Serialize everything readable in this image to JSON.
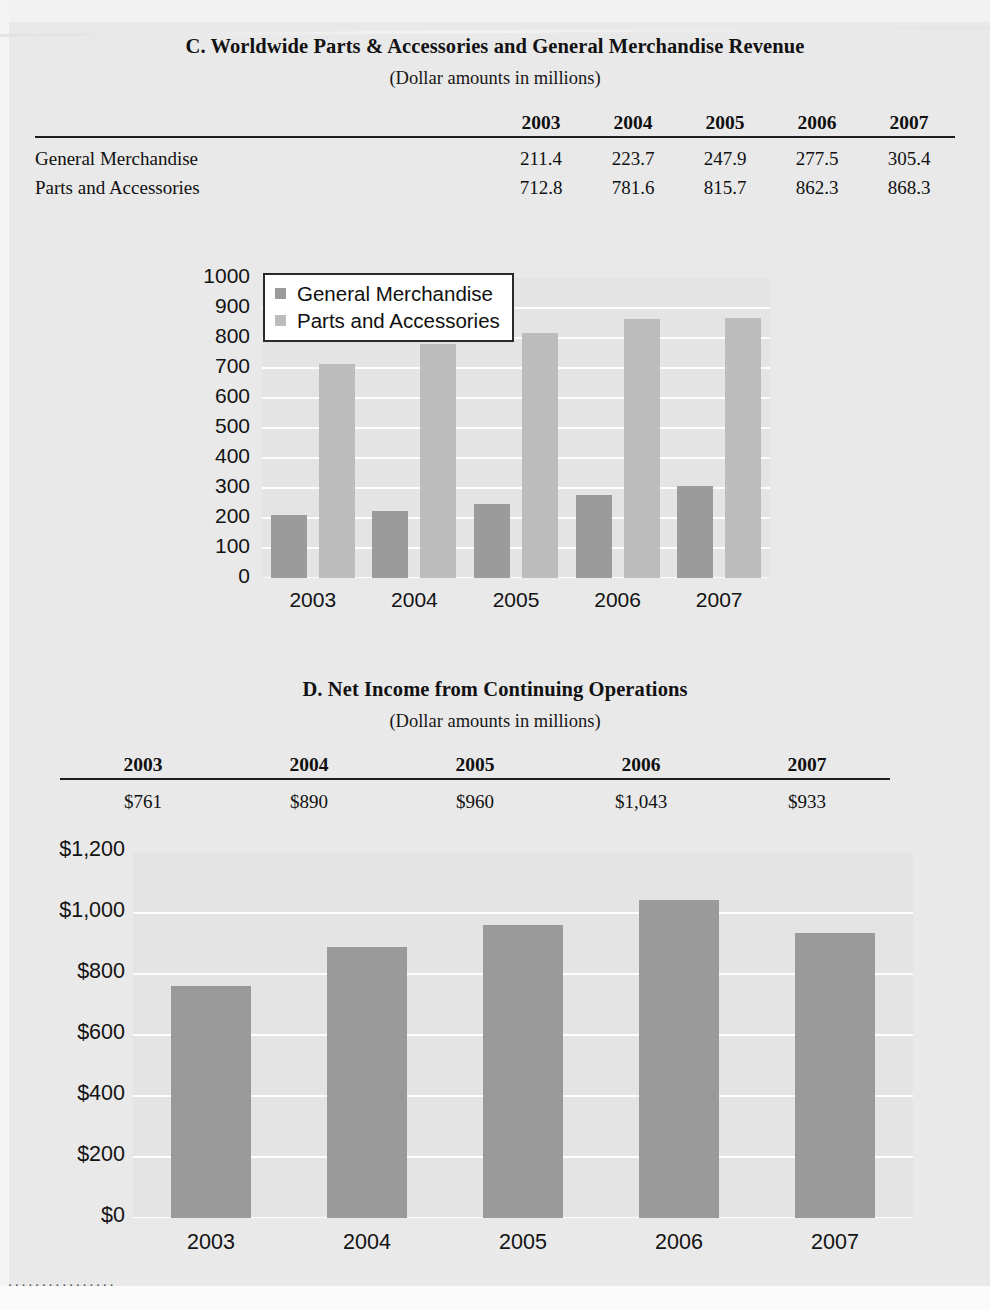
{
  "page": {
    "bottom_dots": "................",
    "colors": {
      "page_background": "#e9e9e9",
      "plot_background": "#e4e4e4",
      "gridline": "#fdfdfd",
      "bar_general_merchandise": "#9b9b9b",
      "bar_parts_and_accessories": "#bcbcbc",
      "bar_net_income": "#9a9a9a",
      "rule": "#1d1d1d",
      "text": "#101010"
    }
  },
  "section_c": {
    "title": "C. Worldwide Parts & Accessories and General Merchandise Revenue",
    "subtitle": "(Dollar amounts in millions)",
    "table": {
      "row_label_header": "",
      "columns": [
        "2003",
        "2004",
        "2005",
        "2006",
        "2007"
      ],
      "rows": [
        {
          "label": "General Merchandise",
          "values": [
            "211.4",
            "223.7",
            "247.9",
            "277.5",
            "305.4"
          ]
        },
        {
          "label": "Parts and Accessories",
          "values": [
            "712.8",
            "781.6",
            "815.7",
            "862.3",
            "868.3"
          ]
        }
      ]
    },
    "legend": [
      {
        "label": "General Merchandise",
        "color": "#9b9b9b"
      },
      {
        "label": "Parts and Accessories",
        "color": "#bcbcbc"
      }
    ]
  },
  "section_d": {
    "title": "D. Net Income from Continuing Operations",
    "subtitle": "(Dollar amounts in millions)",
    "table": {
      "columns": [
        "2003",
        "2004",
        "2005",
        "2006",
        "2007"
      ],
      "values": [
        "$761",
        "$890",
        "$960",
        "$1,043",
        "$933"
      ]
    }
  },
  "chart_data": [
    {
      "id": "chart-c",
      "type": "bar",
      "title": "C. Worldwide Parts & Accessories and General Merchandise Revenue",
      "subtitle": "(Dollar amounts in millions)",
      "xlabel": "",
      "ylabel": "",
      "categories": [
        "2003",
        "2004",
        "2005",
        "2006",
        "2007"
      ],
      "series": [
        {
          "name": "General Merchandise",
          "values": [
            211.4,
            223.7,
            247.9,
            277.5,
            305.4
          ],
          "color": "#9b9b9b"
        },
        {
          "name": "Parts and Accessories",
          "values": [
            712.8,
            781.6,
            815.7,
            862.3,
            868.3
          ],
          "color": "#bcbcbc"
        }
      ],
      "ylim": [
        0,
        1000
      ],
      "yticks": [
        0,
        100,
        200,
        300,
        400,
        500,
        600,
        700,
        800,
        900,
        1000
      ],
      "ytick_labels": [
        "0",
        "100",
        "200",
        "300",
        "400",
        "500",
        "600",
        "700",
        "800",
        "900",
        "1000"
      ],
      "grid": true,
      "legend_position": "top-left"
    },
    {
      "id": "chart-d",
      "type": "bar",
      "title": "D. Net Income from Continuing Operations",
      "subtitle": "(Dollar amounts in millions)",
      "xlabel": "",
      "ylabel": "",
      "categories": [
        "2003",
        "2004",
        "2005",
        "2006",
        "2007"
      ],
      "values": [
        761,
        890,
        960,
        1043,
        933
      ],
      "ylim": [
        0,
        1200
      ],
      "yticks": [
        0,
        200,
        400,
        600,
        800,
        1000,
        1200
      ],
      "ytick_labels": [
        "$0",
        "$200",
        "$400",
        "$600",
        "$800",
        "$1,000",
        "$1,200"
      ],
      "grid": true,
      "legend_position": "none",
      "series_color": "#9a9a9a"
    }
  ]
}
